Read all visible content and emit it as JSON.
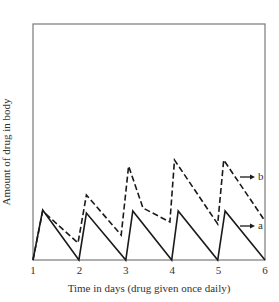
{
  "chart_data": {
    "type": "line",
    "title": "",
    "xlabel": "Time in days (drug given once daily)",
    "ylabel": "Amount of drug in body",
    "xlim": [
      1,
      6
    ],
    "ylim": [
      0,
      4.72
    ],
    "x_ticks": [
      "1",
      "2",
      "3",
      "4",
      "5",
      "6"
    ],
    "y_ticks": [],
    "grid": false,
    "legend_position": "inline-right",
    "series": [
      {
        "name": "a",
        "style": "solid",
        "x": [
          1.0,
          1.21,
          1.99,
          2.15,
          3.0,
          3.15,
          3.99,
          4.13,
          4.98,
          5.14,
          6.0
        ],
        "y": [
          0.0,
          1.0,
          0.0,
          0.94,
          0.0,
          0.98,
          0.0,
          0.98,
          0.0,
          0.98,
          0.0
        ]
      },
      {
        "name": "b",
        "style": "dashed",
        "x": [
          1.0,
          1.21,
          1.97,
          2.15,
          2.9,
          3.06,
          3.37,
          3.95,
          4.05,
          4.98,
          5.11,
          6.0
        ],
        "y": [
          0.0,
          0.98,
          0.34,
          1.3,
          0.5,
          1.88,
          1.04,
          0.76,
          2.0,
          0.72,
          2.0,
          0.78
        ]
      }
    ],
    "annotations": [
      {
        "text": "b",
        "arrow": true,
        "attached_to": "b"
      },
      {
        "text": "a",
        "arrow": true,
        "attached_to": "a"
      }
    ]
  },
  "axis": {
    "ylabel": "Amount of drug in body",
    "xlabel": "Time in days (drug given once daily)",
    "ticks": [
      "1",
      "2",
      "3",
      "4",
      "5",
      "6"
    ]
  },
  "labels": {
    "b": "b",
    "a": "a"
  },
  "colors": {
    "line": "#1a1a1a",
    "frame": "#7a7a7a"
  }
}
